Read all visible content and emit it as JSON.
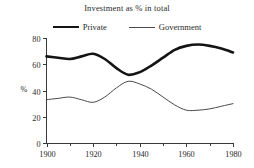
{
  "chart_data": {
    "type": "line",
    "title": "Investment as % in total",
    "xlabel": "",
    "ylabel": "%",
    "xlim": [
      1900,
      1980
    ],
    "ylim": [
      0,
      80
    ],
    "grid": false,
    "legend_position": "top-center",
    "x_ticks": [
      "1900",
      "1920",
      "1940",
      "1960",
      "1980"
    ],
    "x_tick_values": [
      1900,
      1920,
      1940,
      1960,
      1980
    ],
    "x_minor_tick_values": [
      1910,
      1930,
      1950,
      1970
    ],
    "y_ticks": [
      "0",
      "20",
      "40",
      "60",
      "80"
    ],
    "y_tick_values": [
      0,
      20,
      40,
      60,
      80
    ],
    "x": [
      1900,
      1905,
      1910,
      1915,
      1920,
      1925,
      1930,
      1935,
      1940,
      1945,
      1950,
      1955,
      1960,
      1965,
      1970,
      1975,
      1980
    ],
    "series": [
      {
        "name": "Private",
        "color": "#141414",
        "style": "thick",
        "values": [
          66,
          65,
          64,
          66,
          68,
          64,
          57,
          52,
          54,
          59,
          65,
          71,
          74,
          75,
          74,
          72,
          69
        ]
      },
      {
        "name": "Government",
        "color": "#4a4a4a",
        "style": "thin",
        "values": [
          33,
          34,
          35,
          33,
          31,
          35,
          42,
          47,
          45,
          41,
          35,
          29,
          25,
          25,
          26,
          28,
          30
        ]
      }
    ]
  }
}
